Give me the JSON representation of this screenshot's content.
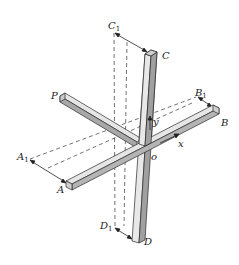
{
  "diagram": {
    "colors": {
      "background": "#ffffff",
      "bar_light": "#e6e6e6",
      "bar_mid": "#c8c8c8",
      "bar_dark": "#9a9a9a",
      "outline": "#2a2a2a",
      "dashed": "#333333"
    },
    "labels": {
      "C1": {
        "main": "C",
        "sub": "1"
      },
      "C": "C",
      "P": "P",
      "B1": {
        "main": "B",
        "sub": "1"
      },
      "B": "B",
      "y": "y",
      "x": "x",
      "o": "o",
      "A1": {
        "main": "A",
        "sub": "1"
      },
      "A": "A",
      "D1": {
        "main": "D",
        "sub": "1"
      },
      "D": "D"
    }
  }
}
